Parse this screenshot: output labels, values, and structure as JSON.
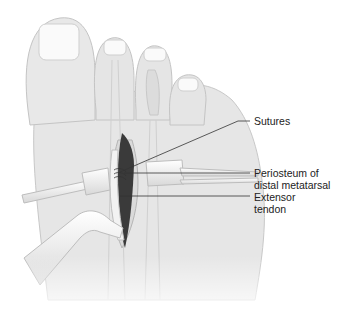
{
  "figure": {
    "labels": {
      "sutures": "Sutures",
      "periosteum_line1": "Periosteum of",
      "periosteum_line2": "distal metatarsal",
      "extensor_line1": "Extensor",
      "extensor_line2": "tendon"
    },
    "colors": {
      "skin": "#e6e6e6",
      "skin_shade": "#d6d6d6",
      "outline": "#c4c4c4",
      "nail": "#fafafa",
      "incision_cavity": "#3a3a3a",
      "instrument": "#efefef",
      "leader_line": "#333333",
      "text": "#222222"
    }
  }
}
